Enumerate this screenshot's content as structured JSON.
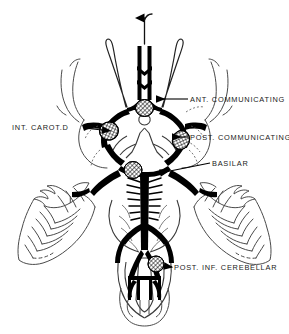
{
  "figure": {
    "type": "anatomical-line-drawing",
    "orientation": "inferior (basal) view of brain, anterior at top",
    "background_color": "#ffffff",
    "ink_color": "#000000",
    "outline_color": "#3a3a3a"
  },
  "labels": [
    {
      "id": "ant-communicating",
      "text": "ANT.  COMMUNICATING",
      "side": "right",
      "leader": "horizontal line with left-pointing arrowhead",
      "target": "anterior communicating artery"
    },
    {
      "id": "post-communicating",
      "text": "POST.  COMMUNICATING",
      "side": "right",
      "leader": "horizontal line with left-pointing arrowhead",
      "target": "posterior communicating artery"
    },
    {
      "id": "basilar",
      "text": "BASILAR",
      "side": "right",
      "leader": "horizontal line with left-pointing arrowhead",
      "target": "basilar artery"
    },
    {
      "id": "post-inf-cerebellar",
      "text": "POST.  INF.  CEREBELLAR",
      "side": "right",
      "leader": "horizontal line with left-pointing arrowhead",
      "target": "posterior inferior cerebellar artery"
    },
    {
      "id": "int-carot-d",
      "text": "INT.  CAROT.D",
      "side": "left",
      "leader": "horizontal line with right-pointing arrowhead",
      "target": "right internal carotid artery"
    }
  ],
  "markers": [
    {
      "id": "marker-ant-comm",
      "style": "cross-hatched ellipse",
      "at": "anterior communicating artery"
    },
    {
      "id": "marker-carotid-left",
      "style": "cross-hatched ellipse",
      "at": "internal carotid artery (image left)"
    },
    {
      "id": "marker-carotid-right",
      "style": "cross-hatched ellipse",
      "at": "internal carotid artery (image right)"
    },
    {
      "id": "marker-basilar",
      "style": "cross-hatched ellipse",
      "at": "basilar artery tip"
    },
    {
      "id": "marker-pica",
      "style": "cross-hatched ellipse",
      "at": "posterior inferior cerebellar artery origin"
    }
  ],
  "structures": [
    "anterior cerebral arteries",
    "anterior communicating artery",
    "internal carotid arteries",
    "middle cerebral arteries",
    "posterior communicating arteries",
    "posterior cerebral arteries",
    "basilar artery",
    "pontine branches",
    "superior cerebellar arteries",
    "anterior inferior cerebellar arteries",
    "posterior inferior cerebellar arteries",
    "vertebral arteries",
    "anterior spinal artery",
    "cerebellar hemispheres",
    "temporal lobes",
    "medulla oblongata",
    "spinal cord"
  ],
  "flow_arrow": {
    "id": "superior-flow-arrow",
    "direction": "upward",
    "meaning": "direction of blood flow in anterior cerebral artery"
  }
}
